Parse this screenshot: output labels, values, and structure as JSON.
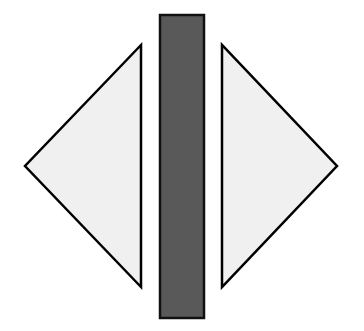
{
  "diagram": {
    "background": "#ffffff",
    "shapes": [
      {
        "id": "left-triangle",
        "type": "triangle",
        "direction": "left",
        "points": "141,45 141,287 25,166",
        "fill": "#f0f0f0",
        "stroke": "#000000"
      },
      {
        "id": "center-bar",
        "type": "rectangle",
        "x": 160,
        "y": 15,
        "width": 44,
        "height": 303,
        "fill": "#595959",
        "stroke": "#111111"
      },
      {
        "id": "right-triangle",
        "type": "triangle",
        "direction": "right",
        "points": "222,45 222,287 337,166",
        "fill": "#f0f0f0",
        "stroke": "#000000"
      }
    ]
  }
}
